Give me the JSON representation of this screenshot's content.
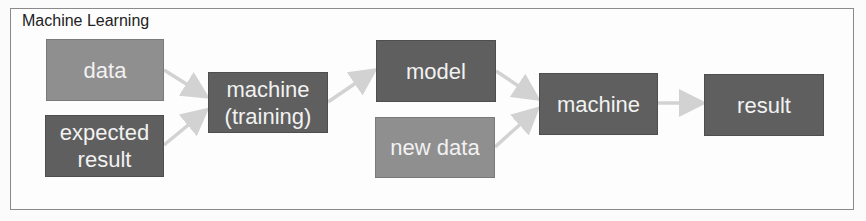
{
  "diagram": {
    "title": "Machine Learning",
    "nodes": [
      {
        "id": "data",
        "label": "data",
        "shade": "light"
      },
      {
        "id": "expected_result",
        "label": "expected\nresult",
        "shade": "dark"
      },
      {
        "id": "machine_training",
        "label": "machine\n(training)",
        "shade": "dark"
      },
      {
        "id": "model",
        "label": "model",
        "shade": "dark"
      },
      {
        "id": "new_data",
        "label": "new data",
        "shade": "light"
      },
      {
        "id": "machine",
        "label": "machine",
        "shade": "dark"
      },
      {
        "id": "result",
        "label": "result",
        "shade": "dark"
      }
    ],
    "edges": [
      {
        "from": "data",
        "to": "machine_training"
      },
      {
        "from": "expected_result",
        "to": "machine_training"
      },
      {
        "from": "machine_training",
        "to": "model"
      },
      {
        "from": "model",
        "to": "machine"
      },
      {
        "from": "new_data",
        "to": "machine"
      },
      {
        "from": "machine",
        "to": "result"
      }
    ],
    "colors": {
      "light_box": "#8f8f8f",
      "dark_box": "#5f5f5f",
      "arrow": "#d2d2d2",
      "text": "#f2f2f2"
    }
  },
  "labels": {
    "data": "data",
    "expected_line1": "expected",
    "expected_line2": "result",
    "machine_training_line1": "machine",
    "machine_training_line2": "(training)",
    "model": "model",
    "new_data": "new data",
    "machine": "machine",
    "result": "result"
  }
}
